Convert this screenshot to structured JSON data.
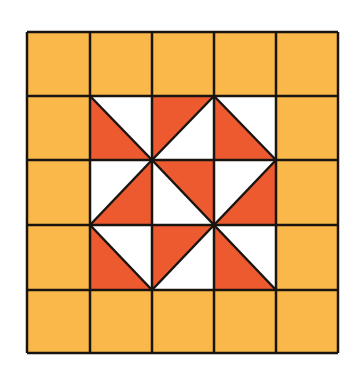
{
  "diagram": {
    "type": "quilt-grid",
    "rows": 5,
    "cols": 5,
    "origin": {
      "x": 27,
      "y": 32
    },
    "col_lines": [
      27,
      90,
      152,
      214,
      276,
      338
    ],
    "row_lines": [
      32,
      96,
      160,
      225,
      290,
      353
    ],
    "colors": {
      "border_fill": "#FBB84A",
      "red": "#EE5A30",
      "white": "#FFFFFF",
      "line": "#1A1410"
    },
    "outer_ring": "all 16 border cells filled solid orange-yellow",
    "center_cells": [
      {
        "row": 1,
        "col": 1,
        "diagonal": "tl-br",
        "red_half": "bottom-left"
      },
      {
        "row": 1,
        "col": 2,
        "diagonal": "tr-bl",
        "red_half": "top-left"
      },
      {
        "row": 1,
        "col": 3,
        "diagonal": "tl-br",
        "red_half": "bottom-left"
      },
      {
        "row": 2,
        "col": 1,
        "diagonal": "tr-bl",
        "red_half": "bottom-right"
      },
      {
        "row": 2,
        "col": 2,
        "diagonal": "tl-br",
        "red_half": "top-right"
      },
      {
        "row": 2,
        "col": 3,
        "diagonal": "tr-bl",
        "red_half": "bottom-right"
      },
      {
        "row": 3,
        "col": 1,
        "diagonal": "tl-br",
        "red_half": "bottom-left"
      },
      {
        "row": 3,
        "col": 2,
        "diagonal": "tr-bl",
        "red_half": "top-left"
      },
      {
        "row": 3,
        "col": 3,
        "diagonal": "tl-br",
        "red_half": "bottom-left"
      }
    ]
  }
}
